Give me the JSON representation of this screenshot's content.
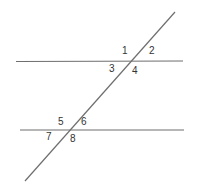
{
  "diagram": {
    "type": "parallel-lines-with-transversal",
    "line_color": "#6e6e6e",
    "label_color": "#333333",
    "lines": [
      {
        "id": "top-parallel",
        "x1": 16,
        "y1": 61.5,
        "x2": 183,
        "y2": 61
      },
      {
        "id": "bottom-parallel",
        "x1": 20,
        "y1": 130,
        "x2": 184,
        "y2": 130
      },
      {
        "id": "transversal",
        "x1": 25,
        "y1": 181,
        "x2": 175,
        "y2": 12
      }
    ],
    "angle_labels": [
      {
        "text": "1",
        "x": 122,
        "y": 54
      },
      {
        "text": "2",
        "x": 149,
        "y": 54
      },
      {
        "text": "3",
        "x": 109,
        "y": 72
      },
      {
        "text": "4",
        "x": 132,
        "y": 74
      },
      {
        "text": "5",
        "x": 58,
        "y": 125
      },
      {
        "text": "6",
        "x": 81,
        "y": 125
      },
      {
        "text": "7",
        "x": 46,
        "y": 140
      },
      {
        "text": "8",
        "x": 70,
        "y": 142
      }
    ]
  }
}
